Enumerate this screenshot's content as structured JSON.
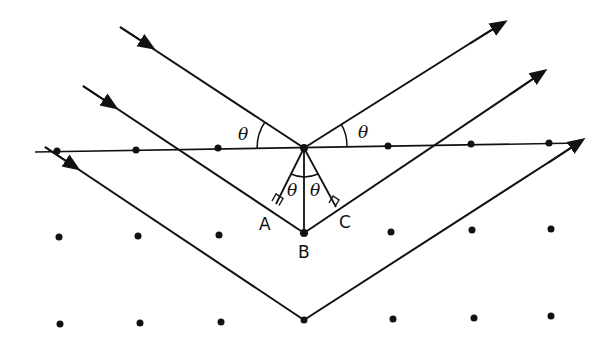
{
  "diagram": {
    "type": "bragg-diffraction",
    "colors": {
      "ink": "#111111",
      "background": "#ffffff"
    },
    "labels": {
      "A": "A",
      "B": "B",
      "C": "C",
      "theta_incident": "θ",
      "theta_reflected": "θ",
      "theta_left_inner": "θ",
      "theta_right_inner": "θ"
    },
    "lattice_rows": [
      {
        "name": "surface-plane",
        "points": [
          [
            57,
            151
          ],
          [
            136,
            150
          ],
          [
            218,
            148
          ],
          [
            304,
            148
          ],
          [
            388,
            146
          ],
          [
            471,
            144
          ],
          [
            549,
            143
          ]
        ]
      },
      {
        "name": "second-plane",
        "points": [
          [
            59,
            237
          ],
          [
            138,
            236
          ],
          [
            219,
            235
          ],
          [
            304,
            233
          ],
          [
            391,
            232
          ],
          [
            472,
            230
          ],
          [
            551,
            229
          ]
        ]
      },
      {
        "name": "third-plane",
        "points": [
          [
            60,
            324
          ],
          [
            140,
            323
          ],
          [
            221,
            322
          ],
          [
            304,
            320
          ],
          [
            393,
            319
          ],
          [
            474,
            318
          ],
          [
            551,
            316
          ]
        ]
      }
    ],
    "rays": [
      {
        "name": "ray-1",
        "start": [
          120,
          27
        ],
        "vertex": [
          304,
          148
        ],
        "end": [
          500,
          25
        ]
      },
      {
        "name": "ray-2",
        "start": [
          83,
          86
        ],
        "vertex": [
          304,
          233
        ],
        "end": [
          540,
          74
        ]
      },
      {
        "name": "ray-3",
        "start": [
          45,
          147
        ],
        "vertex": [
          304,
          320
        ],
        "end": [
          578,
          143
        ]
      }
    ]
  }
}
